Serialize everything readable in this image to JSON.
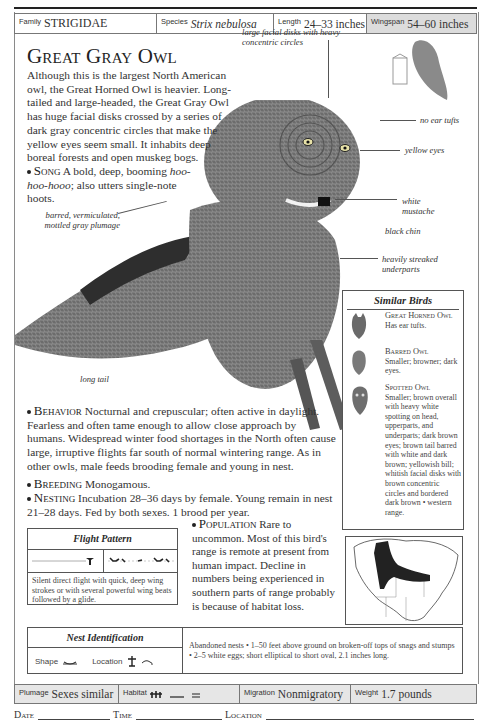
{
  "header": {
    "family_label": "Family",
    "family_value": "STRIGIDAE",
    "species_label": "Species",
    "species_value": "Strix nebulosa",
    "length_label": "Length",
    "length_value": "24–33 inches",
    "wingspan_label": "Wingspan",
    "wingspan_value": "54–60 inches"
  },
  "title": "Great Gray Owl",
  "intro": "Although this is the largest North American owl, the Great Horned Owl is heavier. Long-tailed and large-headed, the Great Gray Owl has huge facial disks crossed by a series of dark gray concentric circles that make the yellow eyes seem small. It inhabits deep boreal forests and open muskeg bogs.",
  "song": {
    "head": "Song",
    "text_before": " A bold, deep, booming ",
    "italic": "hoo-hoo-hooo",
    "text_after": "; also utters single-note hoots."
  },
  "callouts": {
    "facial_disks": "large facial disks with heavy concentric circles",
    "no_ear_tufts": "no ear tufts",
    "yellow_eyes": "yellow eyes",
    "white_mustache": "white mustache",
    "black_chin": "black chin",
    "underparts": "heavily streaked underparts",
    "plumage": "barred, vermiculated, mottled gray plumage",
    "long_tail": "long tail"
  },
  "behavior": {
    "head": "Behavior",
    "text": " Nocturnal and crepuscular; often active in daylight. Fearless and often tame enough to allow close approach by humans. Widespread winter food shortages in the North often cause large, irruptive flights far south of normal wintering range. As in other owls, male feeds brooding female and young in nest."
  },
  "breeding": {
    "head": "Breeding",
    "text": " Monogamous."
  },
  "nesting": {
    "head": "Nesting",
    "text": " Incubation 28–36 days by female. Young remain in nest 21–28 days. Fed by both sexes. 1 brood per year."
  },
  "population": {
    "head": "Population",
    "text": " Rare to uncommon. Most of this bird's range is remote at present from human impact. Decline in numbers being experienced in southern parts of range probably is because of habitat loss."
  },
  "similar_birds": {
    "title": "Similar Birds",
    "items": [
      {
        "name": "Great Horned Owl",
        "desc": "Has ear tufts."
      },
      {
        "name": "Barred Owl",
        "desc": "Smaller; browner; dark eyes."
      },
      {
        "name": "Spotted Owl",
        "desc": "Smaller; brown overall with heavy white spotting on head, upperparts, and underparts; dark brown eyes; brown tail barred with white and dark brown; yellowish bill; whitish facial disks with brown concentric circles and bordered dark brown • western range."
      }
    ]
  },
  "flight_pattern": {
    "title": "Flight Pattern",
    "desc": "Silent direct flight with quick, deep wing strokes or with several powerful wing beats followed by a glide."
  },
  "nest_identification": {
    "title": "Nest Identification",
    "shape_label": "Shape",
    "location_label": "Location",
    "desc": "Abandoned nests • 1–50 feet above ground on broken-off tops of snags and stumps • 2–5 white eggs; short elliptical to short oval, 2.1 inches long."
  },
  "footer": {
    "plumage_label": "Plumage",
    "plumage_value": "Sexes similar",
    "habitat_label": "Habitat",
    "habitat_icons": [
      "forest-icon",
      "bog-icon",
      "water-icon"
    ],
    "migration_label": "Migration",
    "migration_value": "Nonmigratory",
    "weight_label": "Weight",
    "weight_value": "1.7 pounds"
  },
  "log": {
    "date_label": "Date",
    "time_label": "Time",
    "location_label": "Location"
  },
  "colors": {
    "shaded_cell": "#dcdcdc",
    "footer_bg": "#e6e6e6",
    "range_fill": "#222222",
    "silhouette": "#8a8a8a"
  }
}
